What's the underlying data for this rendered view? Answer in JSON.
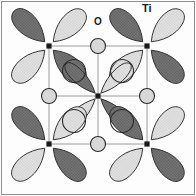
{
  "figure": {
    "type": "crystal-orbital-diagram",
    "width": 196,
    "height": 196,
    "background": "#fdfdfd",
    "frame": {
      "visible": true,
      "color": "#8c8c8c",
      "stroke_width": 1,
      "x": 1,
      "y": 1,
      "w": 194,
      "h": 194
    }
  },
  "labels": [
    {
      "name": "oxygen-label",
      "text": "O",
      "x": 94,
      "y": 17,
      "font_size": 10
    },
    {
      "name": "titanium-label",
      "text": "Ti",
      "x": 142,
      "y": 3,
      "font_size": 11
    }
  ],
  "colors": {
    "lobe_dark": "#6e6e6e",
    "lobe_light": "#dcdcdc",
    "lobe_outline": "#2b2b2b",
    "atom_outline": "#2b2b2b",
    "oxygen_fill": "#d8d8d8",
    "titanium_dot": "#1a1a1a",
    "bond_line": "#9a9a9a",
    "frame": "#8c8c8c",
    "background": "#fdfdfd",
    "text": "#1a1a1a"
  },
  "lattice": {
    "description": "2x2 square lattice of Ti sites with O atoms at edge midpoints",
    "cell_size": 98,
    "ti_dot_radius": 2.6,
    "ti_sites": [
      {
        "name": "ti-top-left",
        "x": 49,
        "y": 46,
        "lobe_style": "broad"
      },
      {
        "name": "ti-top-right",
        "x": 147,
        "y": 46,
        "lobe_style": "broad"
      },
      {
        "name": "ti-center",
        "x": 98,
        "y": 96,
        "lobe_style": "narrow"
      },
      {
        "name": "ti-bottom-left",
        "x": 49,
        "y": 144,
        "lobe_style": "broad"
      },
      {
        "name": "ti-bottom-right",
        "x": 147,
        "y": 144,
        "lobe_style": "broad"
      }
    ],
    "oxygen_sites": [
      {
        "name": "oxygen-top-mid",
        "x": 98,
        "y": 46,
        "r": 7.5
      },
      {
        "name": "oxygen-left-mid",
        "x": 49,
        "y": 96,
        "r": 7.5
      },
      {
        "name": "oxygen-right-mid",
        "x": 147,
        "y": 96,
        "r": 7.5
      },
      {
        "name": "oxygen-bottom-mid",
        "x": 98,
        "y": 144,
        "r": 7.5
      },
      {
        "name": "oxygen-inner-ul",
        "x": 74,
        "y": 71,
        "r": 11.5
      },
      {
        "name": "oxygen-inner-ur",
        "x": 122,
        "y": 71,
        "r": 11.5
      },
      {
        "name": "oxygen-inner-ll",
        "x": 74,
        "y": 121,
        "r": 11.5
      },
      {
        "name": "oxygen-inner-lr",
        "x": 122,
        "y": 121,
        "r": 11.5
      }
    ],
    "bonds": [
      {
        "name": "bond-row-top",
        "x1": 49,
        "y1": 46,
        "x2": 147,
        "y2": 46
      },
      {
        "name": "bond-row-mid",
        "x1": 49,
        "y1": 96,
        "x2": 147,
        "y2": 96
      },
      {
        "name": "bond-row-bottom",
        "x1": 49,
        "y1": 144,
        "x2": 147,
        "y2": 144
      },
      {
        "name": "bond-col-left",
        "x1": 49,
        "y1": 46,
        "x2": 49,
        "y2": 144
      },
      {
        "name": "bond-col-mid",
        "x1": 98,
        "y1": 46,
        "x2": 98,
        "y2": 144
      },
      {
        "name": "bond-col-right",
        "x1": 147,
        "y1": 46,
        "x2": 147,
        "y2": 144
      }
    ]
  },
  "orbitals": {
    "note": "Each Ti site carries four d-orbital lobes at 45-degree diagonals; shading alternates dark/light to show phase",
    "lobe_angles_deg": [
      225,
      315,
      45,
      135
    ],
    "lobe_phase_pattern": [
      "dark",
      "light",
      "dark",
      "light"
    ],
    "broad": {
      "length": 46,
      "width": 24,
      "tip_offset": 6
    },
    "narrow": {
      "length": 44,
      "width": 15,
      "tip_offset": 4
    }
  }
}
